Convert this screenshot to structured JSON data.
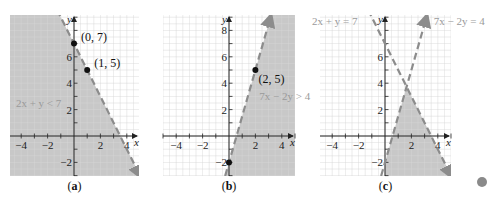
{
  "figure": {
    "colors": {
      "shade": "#c8c8c8",
      "grid_on_shade": "#dcdcdc",
      "grid": "#e4e4e4",
      "axis": "#222222",
      "boundary": "#8c8c8c",
      "point": "#111111",
      "annotation": "#9a9a9a",
      "marker_dot": "#8a8a8a"
    },
    "marker_dot": {
      "x": 482,
      "y": 182,
      "r": 5
    }
  },
  "chart_data": [
    {
      "type": "area",
      "panel": "a",
      "caption": "(a)",
      "title": "",
      "xlabel": "x",
      "ylabel": "y",
      "xlim": [
        -4.85,
        4.9
      ],
      "ylim": [
        -3.0,
        9.2
      ],
      "x_ticks": [
        -4,
        -2,
        2,
        4
      ],
      "x_tick_labels": [
        "−4",
        "−2",
        "2",
        "4"
      ],
      "y_ticks": [
        -2,
        2,
        4,
        6
      ],
      "y_tick_labels": [
        "−2",
        "2",
        "4",
        "6"
      ],
      "grid": true,
      "grid_step": 0.5,
      "boundary_lines": [
        {
          "equation": "2x + y = 7",
          "slope": -2,
          "intercept": 7,
          "style": "dashed"
        }
      ],
      "shaded_region": "2x + y < 7",
      "inequality_label": "2x + y < 7",
      "inequality_label_pos": {
        "x": -4.4,
        "y": 2.5
      },
      "points": [
        {
          "x": 0,
          "y": 7,
          "label": "(0, 7)"
        },
        {
          "x": 1,
          "y": 5,
          "label": "(1, 5)"
        }
      ]
    },
    {
      "type": "area",
      "panel": "b",
      "caption": "(b)",
      "title": "",
      "xlabel": "x",
      "ylabel": "y",
      "xlim": [
        -4.85,
        4.9
      ],
      "ylim": [
        -3.0,
        9.2
      ],
      "x_ticks": [
        -4,
        -2,
        2,
        4
      ],
      "x_tick_labels": [
        "−4",
        "−2",
        "2",
        "4"
      ],
      "y_ticks": [
        -2,
        2,
        4,
        6,
        8
      ],
      "y_tick_labels": [
        "−2",
        "2",
        "4",
        "6",
        "8"
      ],
      "grid": true,
      "grid_step": 0.5,
      "boundary_lines": [
        {
          "equation": "7x − 2y = 4",
          "slope": 3.5,
          "intercept": -2,
          "style": "dashed"
        }
      ],
      "shaded_region": "7x − 2y > 4",
      "inequality_label": "7x − 2y > 4",
      "inequality_label_pos": {
        "x": 2.3,
        "y": 3.0
      },
      "points": [
        {
          "x": 2,
          "y": 5,
          "label": "(2, 5)"
        },
        {
          "x": 0,
          "y": -2,
          "label": ""
        }
      ]
    },
    {
      "type": "area",
      "panel": "c",
      "caption": "(c)",
      "title": "",
      "xlabel": "x",
      "ylabel": "y",
      "xlim": [
        -4.85,
        4.9
      ],
      "ylim": [
        -3.0,
        9.2
      ],
      "x_ticks": [
        -4,
        -2,
        2,
        4
      ],
      "x_tick_labels": [
        "−4",
        "−2",
        "2",
        "4"
      ],
      "y_ticks": [
        -2,
        2,
        4,
        6
      ],
      "y_tick_labels": [
        "−2",
        "2",
        "4",
        "6"
      ],
      "grid": true,
      "grid_step": 0.5,
      "boundary_lines": [
        {
          "equation": "2x + y = 7",
          "slope": -2,
          "intercept": 7,
          "style": "dashed",
          "label": "2x + y = 7"
        },
        {
          "equation": "7x − 2y = 4",
          "slope": 3.5,
          "intercept": -2,
          "style": "dashed",
          "label": "7x − 2y = 4"
        }
      ],
      "shaded_region": "2x + y < 7 and 7x − 2y > 4 (and x ≥ 0)",
      "points": []
    }
  ]
}
